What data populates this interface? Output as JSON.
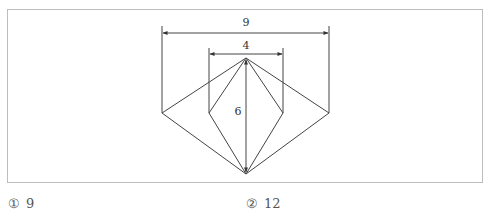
{
  "figure": {
    "dimensions": {
      "outer_width": "9",
      "inner_width": "4",
      "height": "6"
    },
    "stroke_color": "#444444",
    "border_color": "#bdbdbd"
  },
  "choices": [
    {
      "marker": "①",
      "value": "9"
    },
    {
      "marker": "②",
      "value": "12"
    }
  ]
}
